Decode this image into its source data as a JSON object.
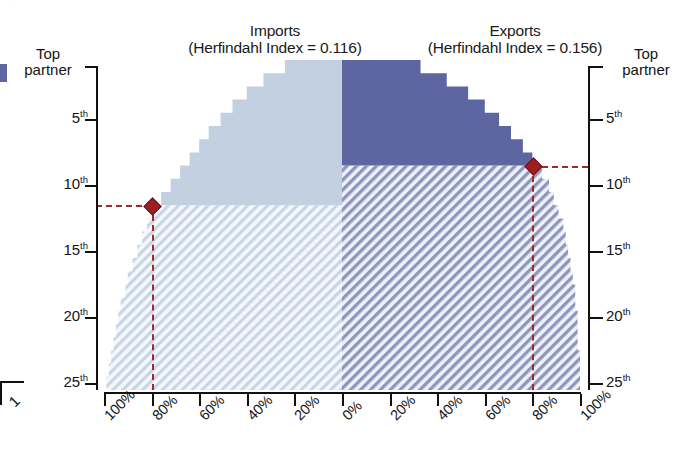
{
  "figure": {
    "left_panel_title": "Imports",
    "left_panel_subtitle": "(Herfindahl Index = 0.116)",
    "right_panel_title": "Exports",
    "right_panel_subtitle": "(Herfindahl Index = 0.156)",
    "cropped_digit": "1"
  },
  "axes": {
    "y_left_labels": [
      "Top partner",
      "5th",
      "10th",
      "15th",
      "20th",
      "25th"
    ],
    "y_right_labels": [
      "Top partner",
      "5th",
      "10th",
      "15th",
      "20th",
      "25th"
    ],
    "y_left_top_line1": "Top",
    "y_left_top_line2": "partner",
    "y_right_top_line1": "Top",
    "y_right_top_line2": "partner",
    "x_left_labels": [
      "100%",
      "80%",
      "60%",
      "40%",
      "20%",
      "0%"
    ],
    "x_right_labels": [
      "20%",
      "40%",
      "60%",
      "80%",
      "100%"
    ]
  },
  "colors": {
    "imports_solid": "#c3d0e2",
    "imports_hatch_bg": "#f2f5fa",
    "imports_hatch_line": "#c9d5e6",
    "exports_solid": "#5e66a2",
    "exports_hatch_bg": "#eef0f7",
    "exports_hatch_line": "#8d96be",
    "marker": "#9d1f21",
    "guide": "#9e2b26",
    "axis": "#111111"
  },
  "chart_data": {
    "type": "area",
    "subtitle": "Imports (Herfindahl Index = 0.116) / Exports (Herfindahl Index = 0.156)",
    "xlabel": "",
    "ylabel": "Partner rank",
    "orientation": "horizontal-mirrored-butterfly",
    "xlim_left": [
      0,
      100
    ],
    "xlim_right": [
      0,
      100
    ],
    "ylim": [
      1,
      26
    ],
    "grid": false,
    "legend_position": "none",
    "y_ticks": [
      1,
      5,
      10,
      15,
      20,
      25
    ],
    "y_tick_labels": [
      "Top partner",
      "5th",
      "10th",
      "15th",
      "20th",
      "25th"
    ],
    "x_ticks_left": [
      100,
      80,
      60,
      40,
      20,
      0
    ],
    "x_ticks_right": [
      20,
      40,
      60,
      80,
      100
    ],
    "series": [
      {
        "name": "Imports",
        "side": "left",
        "herfindahl_index": 0.116,
        "marker_rank": 11,
        "marker_cumulative_share_pct": 80,
        "annotation": "80% of imports come from the top 11 partners",
        "ranks": [
          1,
          2,
          3,
          4,
          5,
          6,
          7,
          8,
          9,
          10,
          11,
          12,
          13,
          14,
          15,
          16,
          17,
          18,
          19,
          20,
          21,
          22,
          23,
          24,
          25
        ],
        "cumulative_share_pct": [
          24,
          33,
          40,
          46,
          51,
          56,
          60,
          64,
          68,
          72,
          76,
          79,
          82,
          84,
          86,
          88,
          90,
          91,
          93,
          94,
          95,
          96,
          97,
          98,
          99
        ]
      },
      {
        "name": "Exports",
        "side": "right",
        "herfindahl_index": 0.156,
        "marker_rank": 8,
        "marker_cumulative_share_pct": 80,
        "annotation": "80% of exports go to the top 8 partners",
        "ranks": [
          1,
          2,
          3,
          4,
          5,
          6,
          7,
          8,
          9,
          10,
          11,
          12,
          13,
          14,
          15,
          16,
          17,
          18,
          19,
          20,
          21,
          22,
          23,
          24,
          25
        ],
        "cumulative_share_pct": [
          33,
          44,
          53,
          60,
          66,
          71,
          76,
          80,
          84,
          87,
          89,
          91,
          93,
          94,
          95,
          96,
          97,
          98,
          98,
          99,
          99,
          99,
          100,
          100,
          100
        ]
      }
    ]
  }
}
